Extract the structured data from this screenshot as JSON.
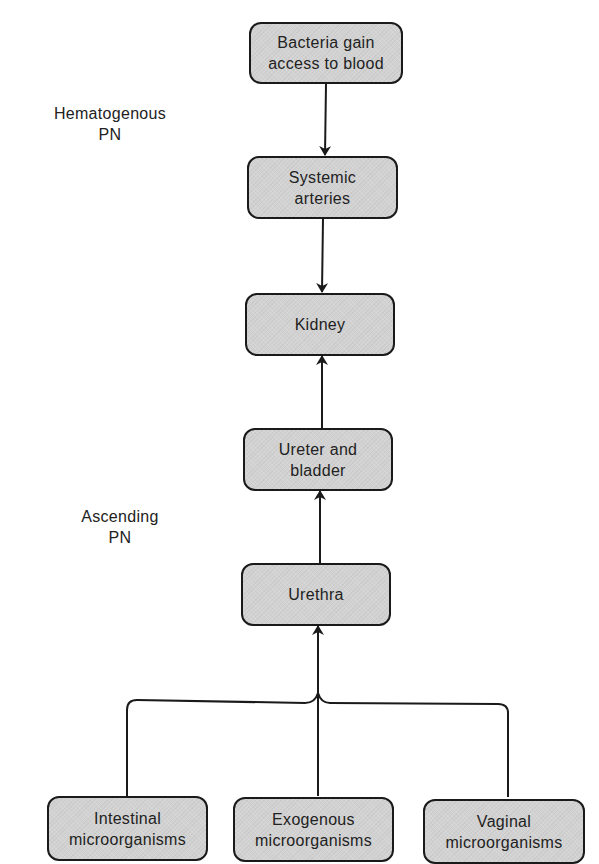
{
  "diagram": {
    "type": "flowchart",
    "nodes": {
      "bacteria_blood": {
        "line1": "Bacteria gain",
        "line2": "access to blood"
      },
      "systemic_arteries": {
        "line1": "Systemic",
        "line2": "arteries"
      },
      "kidney": {
        "line1": "Kidney"
      },
      "ureter_bladder": {
        "line1": "Ureter and",
        "line2": "bladder"
      },
      "urethra": {
        "line1": "Urethra"
      },
      "intestinal": {
        "line1": "Intestinal",
        "line2": "microorganisms"
      },
      "exogenous": {
        "line1": "Exogenous",
        "line2": "microorganisms"
      },
      "vaginal": {
        "line1": "Vaginal",
        "line2": "microorganisms"
      }
    },
    "labels": {
      "hematogenous": {
        "line1": "Hematogenous",
        "line2": "PN"
      },
      "ascending": {
        "line1": "Ascending",
        "line2": "PN"
      }
    },
    "edges": [
      {
        "from": "Bacteria gain access to blood",
        "to": "Systemic arteries"
      },
      {
        "from": "Systemic arteries",
        "to": "Kidney"
      },
      {
        "from": "Ureter and bladder",
        "to": "Kidney"
      },
      {
        "from": "Urethra",
        "to": "Ureter and bladder"
      },
      {
        "from": "Intestinal microorganisms",
        "to": "Urethra"
      },
      {
        "from": "Exogenous microorganisms",
        "to": "Urethra"
      },
      {
        "from": "Vaginal microorganisms",
        "to": "Urethra"
      }
    ],
    "colors": {
      "node_fill": "#d2d2d2",
      "stroke": "#1a1a1a",
      "background": "#ffffff"
    }
  }
}
